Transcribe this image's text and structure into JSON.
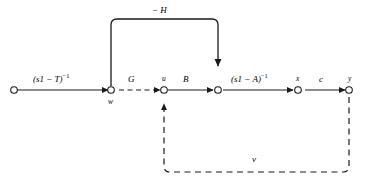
{
  "diagram": {
    "type": "signal-flow-graph",
    "background_color": "#ffffff",
    "line_color": "#1a1a1a",
    "node_fill": "#ffffff",
    "edges": {
      "resolvent_t": {
        "text": "(s1 − T)−1",
        "base": "(s1 − T)",
        "exponent": "−1",
        "style": "solid"
      },
      "gain_g": {
        "text": "G",
        "style": "dashed"
      },
      "gain_b": {
        "text": "B",
        "style": "solid"
      },
      "resolvent_a": {
        "text": "(s1 − A)−1",
        "base": "(s1 − A)",
        "exponent": "−1",
        "style": "solid"
      },
      "gain_c": {
        "text": "c",
        "style": "solid"
      },
      "feedback_top": {
        "text": "− H",
        "style": "solid"
      },
      "feedback_bottom": {
        "text": "v",
        "style": "dashed"
      }
    },
    "nodes": {
      "source": {
        "label": ""
      },
      "w": {
        "label": "w"
      },
      "u": {
        "label": "u"
      },
      "sum": {
        "label": ""
      },
      "x": {
        "label": "x"
      },
      "y": {
        "label": "y"
      }
    }
  }
}
